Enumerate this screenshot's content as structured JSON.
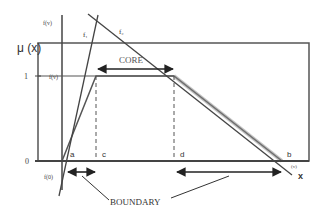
{
  "diagram": {
    "y_axis_label": "μ (x)",
    "x_axis_label": "x",
    "aux_axis_label": "f(v)",
    "tick_one": "1",
    "tick_zero": "0",
    "f_one_label": "f(v)",
    "f_zero_label": "f(0)",
    "b_small_label": "(v)",
    "line_labels": {
      "f1": "f₁",
      "f2": "f₂"
    },
    "points": {
      "a": "a",
      "c": "c",
      "d": "d",
      "b": "b"
    },
    "core_label": "CORE",
    "boundary_label": "BOUNDARY",
    "colors": {
      "line": "#444444",
      "dashed": "#555555",
      "text": "#333333",
      "box": "#555555"
    }
  }
}
